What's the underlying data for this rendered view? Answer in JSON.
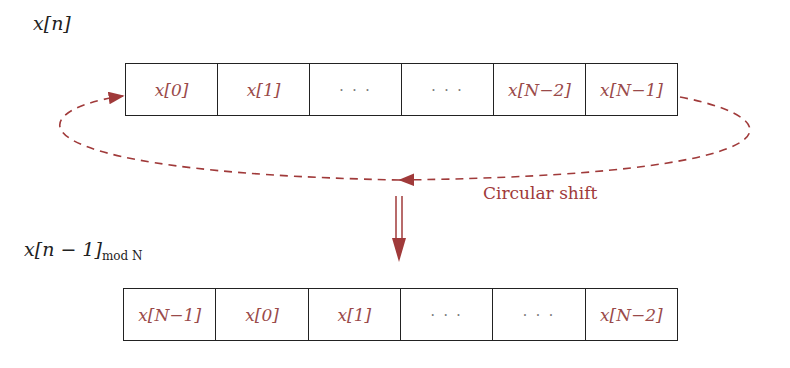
{
  "diagram": {
    "top_label": "x[n]",
    "bottom_label": {
      "main": "x[n − 1]",
      "subscript": "mod N"
    },
    "top_array": [
      "x[0]",
      "x[1]",
      "· · ·",
      "· · ·",
      "x[N−2]",
      "x[N−1]"
    ],
    "bottom_array": [
      "x[N−1]",
      "x[0]",
      "x[1]",
      "· · ·",
      "· · ·",
      "x[N−2]"
    ],
    "caption": "Circular shift",
    "colors": {
      "accent": "#a03a3a",
      "cell_text": "#9a4a4a",
      "border": "#222222"
    }
  }
}
